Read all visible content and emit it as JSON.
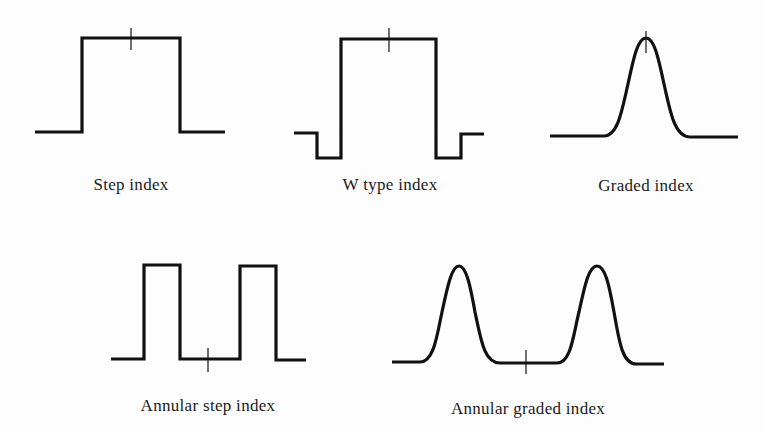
{
  "profiles": [
    {
      "id": "step",
      "label": "Step index",
      "shape": "single rectangular step"
    },
    {
      "id": "w-type",
      "label": "W type index",
      "shape": "rectangular core with depressed cladding on both sides"
    },
    {
      "id": "graded",
      "label": "Graded index",
      "shape": "single smooth bell-shaped peak"
    },
    {
      "id": "annular-step",
      "label": "Annular step index",
      "shape": "two rectangular steps with a low center"
    },
    {
      "id": "annular-graded",
      "label": "Annular graded index",
      "shape": "two smooth bell-shaped peaks with a low center"
    }
  ],
  "axis_marker": "fiber center"
}
